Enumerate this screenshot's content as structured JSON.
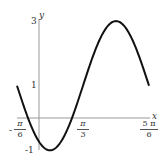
{
  "chart_data": {
    "type": "line",
    "title": "",
    "function": "y = 1 - 2cos(2x - π/6)",
    "xlabel": "x",
    "ylabel": "y",
    "xlim": [
      -0.5236,
      2.618
    ],
    "ylim": [
      -1,
      3
    ],
    "x_ticks": [
      {
        "value": -0.5236,
        "label_sign": "-",
        "num": "π",
        "den": "6"
      },
      {
        "value": 1.0472,
        "label_sign": "",
        "num": "π",
        "den": "3"
      },
      {
        "value": 2.618,
        "label_sign": "",
        "num": "5 π",
        "den": "6"
      }
    ],
    "y_ticks": [
      {
        "value": 3,
        "label": "3"
      },
      {
        "value": 1,
        "label": "1"
      },
      {
        "value": -1,
        "label": "-1"
      }
    ],
    "key_points": [
      {
        "x": -0.5236,
        "y": 1
      },
      {
        "x": 0.2618,
        "y": -1
      },
      {
        "x": 1.0472,
        "y": 1
      },
      {
        "x": 1.8326,
        "y": 3
      },
      {
        "x": 2.618,
        "y": 1
      }
    ],
    "grid": false,
    "legend": null
  },
  "axes": {
    "x_label": "x",
    "y_label": "y",
    "y_tick_3": "3",
    "y_tick_1": "1",
    "y_tick_m1": "-1",
    "x_tick_neg_sign": "-",
    "x_tick_neg_num": "π",
    "x_tick_neg_den": "6",
    "x_tick_mid_num": "π",
    "x_tick_mid_den": "3",
    "x_tick_end_num": "5 π",
    "x_tick_end_den": "6"
  }
}
